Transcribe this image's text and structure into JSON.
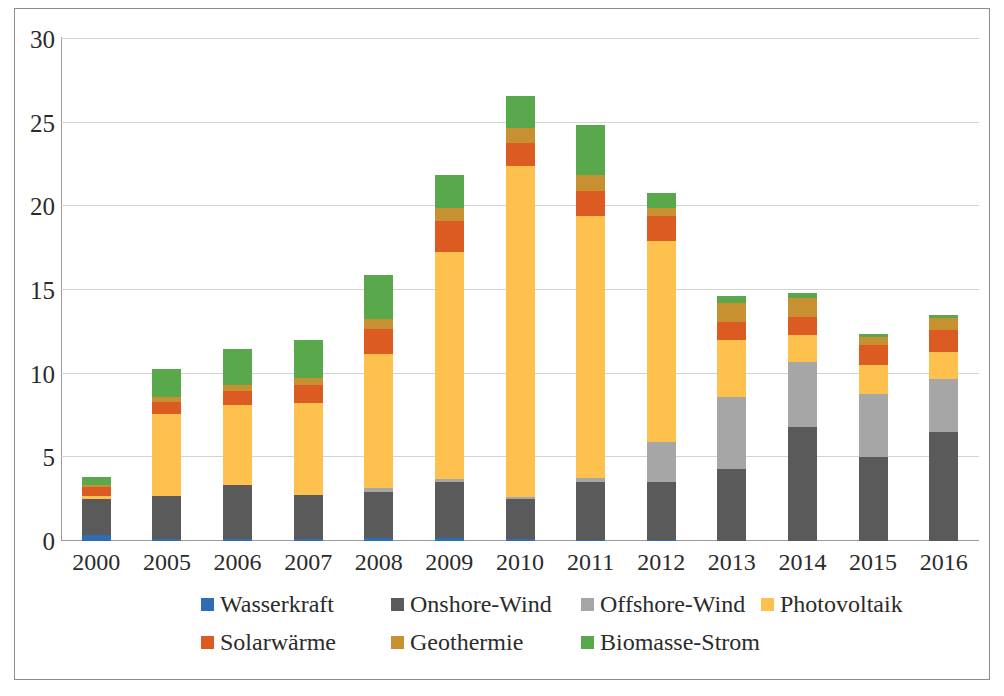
{
  "chart_data": {
    "type": "bar",
    "stacked": true,
    "title": "",
    "subtitle": "",
    "xlabel": "",
    "ylabel": "",
    "ylim": [
      0,
      30
    ],
    "yticks": [
      0,
      5,
      10,
      15,
      20,
      25,
      30
    ],
    "ytick_labels": [
      "0",
      "5",
      "10",
      "15",
      "20",
      "25",
      "30"
    ],
    "grid": true,
    "legend_position": "bottom",
    "categories": [
      "2000",
      "2005",
      "2006",
      "2007",
      "2008",
      "2009",
      "2010",
      "2011",
      "2012",
      "2013",
      "2014",
      "2015",
      "2016"
    ],
    "series": [
      {
        "name": "Wasserkraft",
        "color": "#2E6DB4",
        "values": [
          0.35,
          0.1,
          0.1,
          0.1,
          0.2,
          0.2,
          0.1,
          0.05,
          0.05,
          0.0,
          0.0,
          0.0,
          0.0
        ]
      },
      {
        "name": "Onshore-Wind",
        "color": "#5A5A5A",
        "values": [
          2.15,
          2.6,
          3.25,
          2.65,
          2.75,
          3.3,
          2.4,
          3.45,
          3.45,
          4.3,
          6.8,
          5.0,
          6.5
        ]
      },
      {
        "name": "Offshore-Wind",
        "color": "#A6A6A6",
        "values": [
          0.0,
          0.0,
          0.0,
          0.0,
          0.2,
          0.2,
          0.15,
          0.25,
          2.4,
          4.3,
          3.9,
          3.8,
          3.2
        ]
      },
      {
        "name": "Photovoltaik",
        "color": "#FFC14D",
        "values": [
          0.2,
          4.9,
          4.75,
          5.5,
          8.0,
          13.6,
          19.75,
          15.7,
          12.0,
          3.4,
          1.6,
          1.7,
          1.6
        ]
      },
      {
        "name": "Solarwärme",
        "color": "#DC5B23",
        "values": [
          0.5,
          0.7,
          0.85,
          1.1,
          1.5,
          1.8,
          1.4,
          1.45,
          1.5,
          1.1,
          1.1,
          1.2,
          1.3
        ]
      },
      {
        "name": "Geothermie",
        "color": "#C79030",
        "values": [
          0.15,
          0.3,
          0.35,
          0.4,
          0.6,
          0.8,
          0.9,
          0.95,
          0.5,
          1.1,
          1.1,
          0.5,
          0.7
        ]
      },
      {
        "name": "Biomasse-Strom",
        "color": "#59A84B",
        "values": [
          0.45,
          1.7,
          2.2,
          2.25,
          2.65,
          2.0,
          1.9,
          3.0,
          0.9,
          0.45,
          0.3,
          0.2,
          0.2
        ]
      }
    ],
    "totals": [
      3.8,
      10.3,
      11.5,
      12.0,
      15.9,
      21.9,
      26.6,
      24.85,
      20.8,
      14.65,
      14.8,
      12.4,
      13.5
    ]
  },
  "legend": {
    "row1": [
      "Wasserkraft",
      "Onshore-Wind",
      "Offshore-Wind",
      "Photovoltaik"
    ],
    "row2": [
      "Solarwärme",
      "Geothermie",
      "Biomasse-Strom"
    ]
  },
  "colors": {
    "wasserkraft": "#2E6DB4",
    "onshore_wind": "#5A5A5A",
    "offshore_wind": "#A6A6A6",
    "photovoltaik": "#FFC14D",
    "solarwaerme": "#DC5B23",
    "geothermie": "#C79030",
    "biomasse_strom": "#59A84B",
    "gridline": "#D3D3D3",
    "axis": "#9A9A9A",
    "text": "#2B2B2B",
    "frame": "#8D8D8D"
  }
}
